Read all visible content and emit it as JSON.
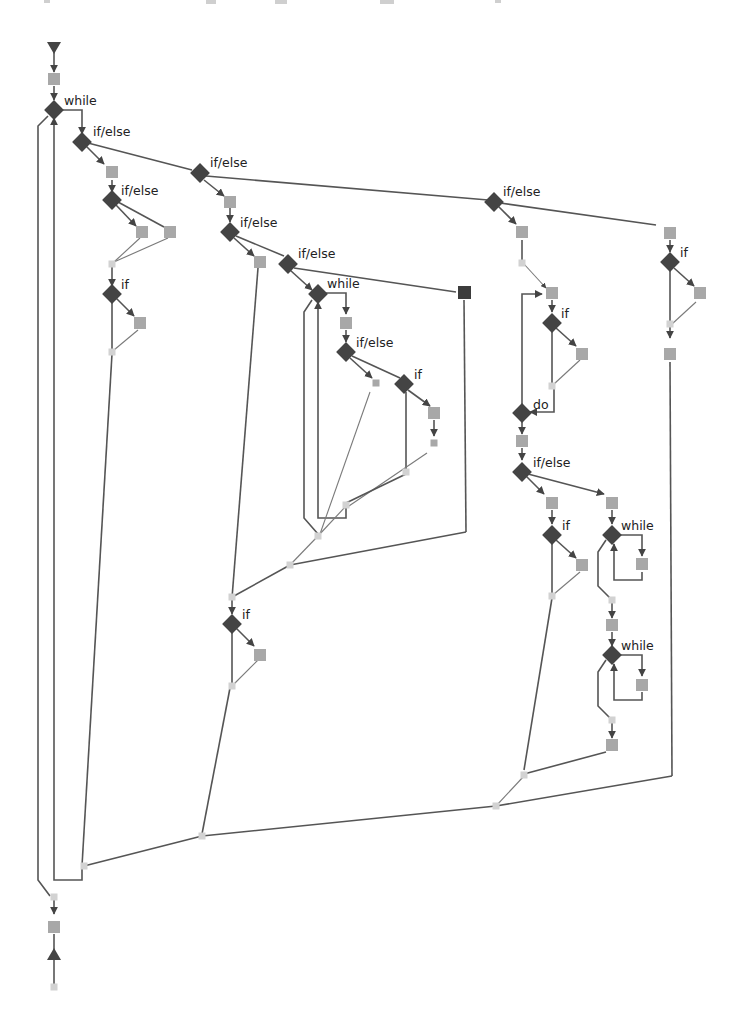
{
  "diagram": {
    "type": "control-flow-graph",
    "colors": {
      "background": "#ffffff",
      "edge": "#555555",
      "decision_node": "#444444",
      "statement_node": "#a8a8a8",
      "junction_node": "#d0d0d0",
      "terminal_node": "#444444",
      "dark_block": "#3c3c3c",
      "label": "#222222"
    },
    "labels": {
      "while_main": "while",
      "ifelse_1": "if/else",
      "ifelse_2": "if/else",
      "ifelse_3": "if/else",
      "ifelse_4": "if/else",
      "if_1": "if",
      "ifelse_5": "if/else",
      "ifelse_6": "if/else",
      "while_2": "while",
      "ifelse_7": "if/else",
      "if_2": "if",
      "if_3": "if",
      "if_4": "if",
      "if_5": "if",
      "do_1": "do",
      "ifelse_8": "if/else",
      "if_6": "if",
      "while_3": "while",
      "while_4": "while"
    },
    "node_counts": {
      "decision": 19,
      "start": 1,
      "end": 1
    }
  }
}
